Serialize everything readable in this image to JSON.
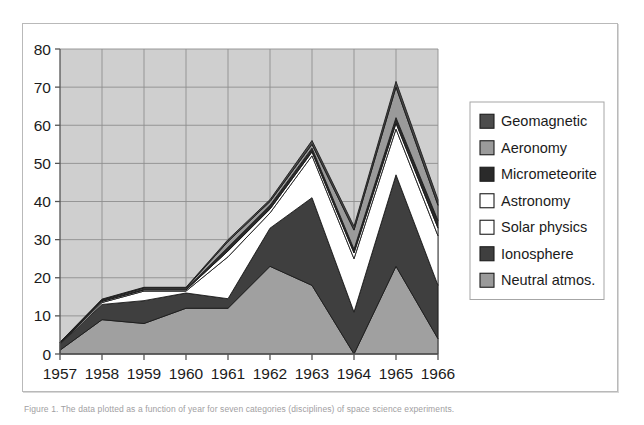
{
  "figure": {
    "caption": "Figure 1. The data plotted as a function of year for seven categories (disciplines) of space science experiments."
  },
  "chart_data": {
    "type": "area",
    "stacked": true,
    "title": "",
    "xlabel": "",
    "ylabel": "",
    "categories": [
      "1957",
      "1958",
      "1959",
      "1960",
      "1961",
      "1962",
      "1963",
      "1964",
      "1965",
      "1966"
    ],
    "x": [
      1957,
      1958,
      1959,
      1960,
      1961,
      1962,
      1963,
      1964,
      1965,
      1966
    ],
    "ylim": [
      0,
      80
    ],
    "yticks": [
      0,
      10,
      20,
      30,
      40,
      50,
      60,
      70,
      80
    ],
    "ytick_labels": [
      "0",
      "10",
      "20",
      "30",
      "40",
      "50",
      "60",
      "70",
      "80"
    ],
    "grid": true,
    "grid_axis": "both",
    "legend_position": "right",
    "plot_background": "#cfcfcf",
    "grid_color": "#8e8e8e",
    "axis_color": "#555555",
    "series_stack_order_bottom_to_top": [
      "Neutral atmos.",
      "Ionosphere",
      "Solar physics",
      "Astronomy",
      "Micrometeorite",
      "Aeronomy",
      "Geomagnetic"
    ],
    "series": [
      {
        "name": "Neutral atmos.",
        "color": "#a0a0a0",
        "values": [
          1,
          9,
          8,
          12,
          12,
          23,
          18,
          0,
          23,
          4
        ]
      },
      {
        "name": "Ionosphere",
        "color": "#3f3f3f",
        "values": [
          1.5,
          4,
          6,
          4,
          2.5,
          10,
          23,
          11,
          24,
          14
        ]
      },
      {
        "name": "Solar physics",
        "color": "#ffffff",
        "values": [
          0.2,
          0.5,
          2.5,
          0.5,
          11,
          4,
          11,
          14,
          12,
          13
        ]
      },
      {
        "name": "Astronomy",
        "color": "#ffffff",
        "values": [
          0.1,
          0.3,
          0.3,
          0.3,
          1.5,
          1,
          1,
          1.5,
          1.5,
          2
        ]
      },
      {
        "name": "Micrometeorite",
        "color": "#2a2a2a",
        "values": [
          0.1,
          0.2,
          0.2,
          0.2,
          1,
          1,
          1,
          1,
          1.5,
          2
        ]
      },
      {
        "name": "Aeronomy",
        "color": "#9a9a9a",
        "values": [
          0.1,
          0.2,
          0.3,
          0.3,
          1.5,
          1,
          1,
          5,
          8,
          4
        ]
      },
      {
        "name": "Geomagnetic",
        "color": "#4c4c4c",
        "values": [
          0.1,
          0.2,
          0.2,
          0.2,
          0.5,
          0.5,
          1,
          1,
          1.5,
          1.5
        ]
      }
    ],
    "legend_entries": [
      {
        "label": "Geomagnetic",
        "color": "#4c4c4c"
      },
      {
        "label": "Aeronomy",
        "color": "#9a9a9a"
      },
      {
        "label": "Micrometeorite",
        "color": "#2a2a2a"
      },
      {
        "label": "Astronomy",
        "color": "#ffffff"
      },
      {
        "label": "Solar physics",
        "color": "#ffffff"
      },
      {
        "label": "Ionosphere",
        "color": "#3f3f3f"
      },
      {
        "label": "Neutral atmos.",
        "color": "#9a9a9a"
      }
    ],
    "annotations": [
      {
        "text": "peak total 1963",
        "value": 56
      },
      {
        "text": "peak total 1965",
        "value": 71
      },
      {
        "text": "dip total 1964",
        "value": 34
      }
    ]
  }
}
